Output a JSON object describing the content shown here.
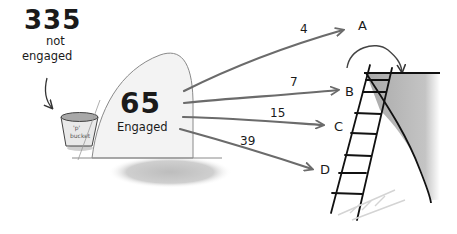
{
  "diagram": {
    "not_engaged": {
      "count": "335",
      "label_line1": "not",
      "label_line2": "engaged"
    },
    "bucket": {
      "label_line1": "'p'",
      "label_line2": "bucket"
    },
    "engaged": {
      "count": "65",
      "label": "Engaged"
    },
    "flows": [
      {
        "value": "4",
        "target": "A"
      },
      {
        "value": "7",
        "target": "B"
      },
      {
        "value": "15",
        "target": "C"
      },
      {
        "value": "39",
        "target": "D"
      }
    ],
    "colors": {
      "arrow": "#6b6b6b",
      "ink": "#1a1a1a",
      "cliff": "#b3b3b3",
      "hill_fill": "#f2f2f2",
      "shadow": "#c8c8c8",
      "bucket": "#a8a8a8"
    }
  }
}
